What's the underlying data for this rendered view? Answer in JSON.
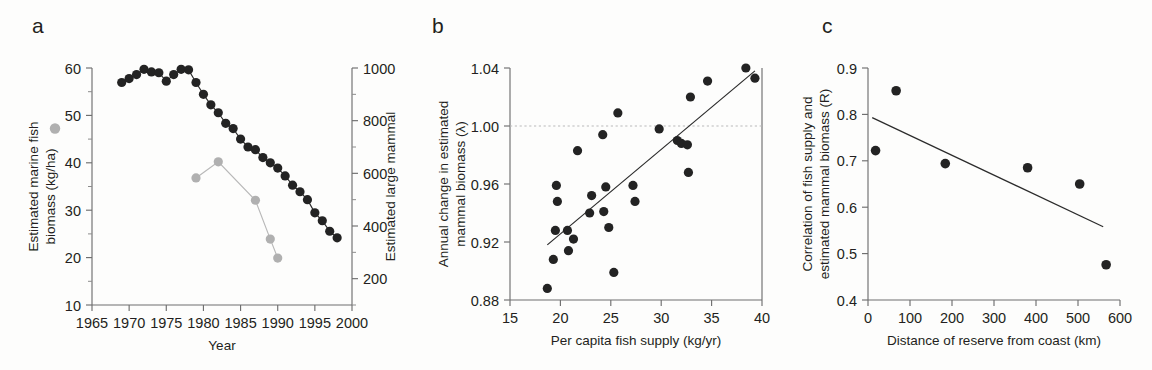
{
  "figure": {
    "panels": [
      "a",
      "b",
      "c"
    ]
  },
  "chart_data": [
    {
      "panel": "a",
      "type": "line",
      "title": "",
      "xlabel": "Year",
      "ylabel_left": "Estimated marine fish biomass (kg/ha)",
      "ylabel_right": "Estimated large mammal biomass (tonsa)",
      "ylabel_left_parts": [
        "Estimated marine fish",
        "biomass (kg/ha)"
      ],
      "ylabel_right_parts": [
        "Estimated large mammal",
        "biomass (tonsa)"
      ],
      "legend": [
        {
          "name": "Estimated marine fish biomass (kg/ha)",
          "marker": "grey-filled-circle",
          "color": "#b0b0b0",
          "axis": "left"
        },
        {
          "name": "Estimated large mammal biomass (tonsa)",
          "marker": "black-filled-circle",
          "color": "#232323",
          "axis": "right"
        }
      ],
      "xlim": [
        1965,
        2000
      ],
      "xticks": [
        1965,
        1970,
        1975,
        1980,
        1985,
        1990,
        1995,
        2000
      ],
      "xtick_labels": [
        "1965",
        "1970",
        "1975",
        "1980",
        "1985",
        "1990",
        "1995",
        "2000"
      ],
      "ylim_left": [
        10,
        60
      ],
      "yticks_left": [
        10,
        20,
        30,
        40,
        50,
        60
      ],
      "ytick_labels_left": [
        "10",
        "20",
        "30",
        "40",
        "50",
        "60"
      ],
      "yminor_left": [
        15,
        25,
        35,
        45,
        55
      ],
      "ylim_right": [
        100,
        1000
      ],
      "yticks_right": [
        200,
        400,
        600,
        800,
        1000
      ],
      "ytick_labels_right": [
        "200",
        "400",
        "600",
        "800",
        "1000"
      ],
      "yminor_right": [
        100,
        300,
        500,
        700,
        900
      ],
      "grid": false,
      "series": [
        {
          "name": "Estimated large mammal biomass (tonsa)",
          "axis": "right",
          "color": "#232323",
          "marker": "circle",
          "x": [
            1969,
            1970,
            1971,
            1972,
            1973,
            1974,
            1975,
            1976,
            1977,
            1978,
            1979,
            1980,
            1981,
            1982,
            1983,
            1984,
            1985,
            1986,
            1987,
            1988,
            1989,
            1990,
            1991,
            1992,
            1993,
            1994,
            1995,
            1996,
            1997,
            1998
          ],
          "values": [
            945,
            960,
            975,
            995,
            985,
            982,
            950,
            975,
            995,
            993,
            945,
            900,
            860,
            830,
            790,
            770,
            730,
            700,
            690,
            660,
            640,
            620,
            590,
            555,
            530,
            500,
            450,
            420,
            380,
            355
          ],
          "values_left_scale": [
            57.0,
            57.9,
            58.7,
            59.8,
            59.3,
            59.1,
            57.2,
            58.7,
            59.8,
            59.7,
            57.0,
            54.5,
            52.2,
            50.6,
            48.3,
            47.2,
            45.0,
            43.3,
            42.7,
            41.0,
            39.9,
            38.8,
            37.1,
            35.1,
            33.7,
            32.0,
            29.2,
            27.5,
            25.3,
            23.6
          ]
        },
        {
          "name": "Estimated marine fish biomass (kg/ha)",
          "axis": "left",
          "color": "#b0b0b0",
          "marker": "circle",
          "x": [
            1979,
            1982,
            1987,
            1989,
            1990
          ],
          "values": [
            36.8,
            40.2,
            32.1,
            23.9,
            19.9
          ]
        }
      ]
    },
    {
      "panel": "b",
      "type": "scatter",
      "title": "",
      "xlabel": "Per capita fish supply (kg/yr)",
      "ylabel": "Annual change in estimated mammal biomass (λ)",
      "ylabel_parts": [
        "Annual change in estimated",
        "mammal biomass (λ)"
      ],
      "xlim": [
        15,
        40
      ],
      "xticks": [
        15,
        20,
        25,
        30,
        35,
        40
      ],
      "xtick_labels": [
        "15",
        "20",
        "25",
        "30",
        "35",
        "40"
      ],
      "ylim": [
        0.88,
        1.04
      ],
      "yticks": [
        0.88,
        0.92,
        0.96,
        1.0,
        1.04
      ],
      "ytick_labels": [
        "0.88",
        "0.92",
        "0.96",
        "1.00",
        "1.04"
      ],
      "grid": false,
      "reference_line": {
        "y": 1.0,
        "style": "dotted",
        "color": "#b9b9b9"
      },
      "fit_line": {
        "x": [
          18.7,
          39.3
        ],
        "y": [
          0.918,
          1.038
        ],
        "color": "#2b2b2b"
      },
      "points": [
        {
          "x": 18.7,
          "y": 0.888
        },
        {
          "x": 19.3,
          "y": 0.908
        },
        {
          "x": 19.5,
          "y": 0.928
        },
        {
          "x": 19.6,
          "y": 0.959
        },
        {
          "x": 19.7,
          "y": 0.948
        },
        {
          "x": 20.7,
          "y": 0.928
        },
        {
          "x": 20.8,
          "y": 0.914
        },
        {
          "x": 21.3,
          "y": 0.922
        },
        {
          "x": 21.7,
          "y": 0.983
        },
        {
          "x": 22.9,
          "y": 0.94
        },
        {
          "x": 23.1,
          "y": 0.952
        },
        {
          "x": 24.2,
          "y": 0.994
        },
        {
          "x": 24.3,
          "y": 0.941
        },
        {
          "x": 24.5,
          "y": 0.958
        },
        {
          "x": 24.8,
          "y": 0.93
        },
        {
          "x": 25.3,
          "y": 0.899
        },
        {
          "x": 25.7,
          "y": 1.009
        },
        {
          "x": 27.2,
          "y": 0.959
        },
        {
          "x": 27.4,
          "y": 0.948
        },
        {
          "x": 29.8,
          "y": 0.998
        },
        {
          "x": 31.6,
          "y": 0.99
        },
        {
          "x": 32.0,
          "y": 0.988
        },
        {
          "x": 32.6,
          "y": 0.987
        },
        {
          "x": 32.7,
          "y": 0.968
        },
        {
          "x": 32.9,
          "y": 1.02
        },
        {
          "x": 34.6,
          "y": 1.031
        },
        {
          "x": 38.4,
          "y": 1.04
        },
        {
          "x": 39.3,
          "y": 1.033
        }
      ]
    },
    {
      "panel": "c",
      "type": "scatter",
      "title": "",
      "xlabel": "Distance of reserve from coast (km)",
      "ylabel": "Correlation of fish supply and estimated mammal biomass (R)",
      "ylabel_parts": [
        "Correlation of fish supply and",
        "estimated mammal biomass (R)"
      ],
      "xlim": [
        0,
        600
      ],
      "xticks": [
        0,
        100,
        200,
        300,
        400,
        500,
        600
      ],
      "xtick_labels": [
        "0",
        "100",
        "200",
        "300",
        "400",
        "500",
        "600"
      ],
      "ylim": [
        0.4,
        0.9
      ],
      "yticks": [
        0.4,
        0.5,
        0.6,
        0.7,
        0.8,
        0.9
      ],
      "ytick_labels": [
        "0.4",
        "0.5",
        "0.6",
        "0.7",
        "0.8",
        "0.9"
      ],
      "grid": false,
      "fit_line": {
        "x": [
          10,
          560
        ],
        "y": [
          0.793,
          0.558
        ],
        "color": "#2b2b2b"
      },
      "points": [
        {
          "x": 18,
          "y": 0.722
        },
        {
          "x": 67,
          "y": 0.851
        },
        {
          "x": 184,
          "y": 0.694
        },
        {
          "x": 380,
          "y": 0.685
        },
        {
          "x": 504,
          "y": 0.65
        },
        {
          "x": 567,
          "y": 0.476
        }
      ]
    }
  ]
}
